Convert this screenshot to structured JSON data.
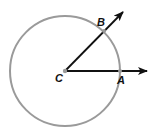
{
  "diagram": {
    "type": "geometry",
    "colors": {
      "circle": "#9a9a9a",
      "rays": "#111111",
      "point": "#9a9a9a",
      "labels": "#111111",
      "background": "#ffffff"
    },
    "circle": {
      "center_label": "C",
      "cx": 65,
      "cy": 71,
      "r": 55
    },
    "points": [
      {
        "id": "C",
        "label": "C",
        "x": 65,
        "y": 71
      },
      {
        "id": "A",
        "label": "A",
        "x": 120,
        "y": 71
      },
      {
        "id": "B",
        "label": "B",
        "x": 104,
        "y": 31
      }
    ],
    "rays": [
      {
        "id": "ray-CA",
        "from": "C",
        "through": "A",
        "x2": 148,
        "y2": 71
      },
      {
        "id": "ray-CB",
        "from": "C",
        "through": "B",
        "x2": 124,
        "y2": 11
      }
    ],
    "labels": {
      "C": "C",
      "A": "A",
      "B": "B"
    }
  }
}
